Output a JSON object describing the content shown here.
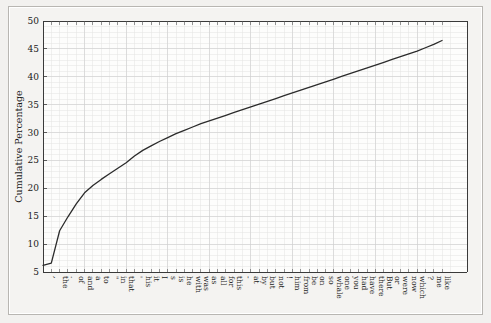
{
  "window": {
    "background_color": "#f2f1ef",
    "frame_color": "#f4f3f1"
  },
  "chart_data": {
    "type": "line",
    "title": "",
    "subtitle": "",
    "xlabel": "",
    "ylabel": "Cumulative Percentage",
    "ylim": [
      5,
      50
    ],
    "xlim": [
      0,
      51
    ],
    "grid": true,
    "legend": "none",
    "y_ticks": [
      5,
      10,
      15,
      20,
      25,
      30,
      35,
      40,
      45,
      50
    ],
    "y_tick_labels": [
      "5",
      "10",
      "15",
      "20",
      "25",
      "30",
      "35",
      "40",
      "45",
      "50"
    ],
    "line_color": "#2b2b2b",
    "categories": [
      ",",
      "the",
      ".",
      "of",
      "and",
      "a",
      "to",
      "\"",
      "in",
      "that",
      "'",
      "his",
      "it",
      "I",
      "s",
      "is",
      "he",
      "with",
      "was",
      "as",
      "all",
      "for",
      "this",
      "-",
      "at",
      "by",
      "but",
      "not",
      "!",
      "him",
      "from",
      "be",
      "on",
      "so",
      "whale",
      "one",
      "you",
      "had",
      "have",
      "there",
      "But",
      "or",
      "were",
      "now",
      "which",
      "?",
      "me",
      "like"
    ],
    "values": [
      6.6,
      12.4,
      14.9,
      17.2,
      19.2,
      20.5,
      21.6,
      22.6,
      23.6,
      24.6,
      25.8,
      26.8,
      27.6,
      28.4,
      29.1,
      29.8,
      30.4,
      31.0,
      31.6,
      32.1,
      32.6,
      33.1,
      33.6,
      34.1,
      34.6,
      35.1,
      35.6,
      36.1,
      36.6,
      37.1,
      37.6,
      38.1,
      38.6,
      39.1,
      39.6,
      40.1,
      40.6,
      41.1,
      41.6,
      42.1,
      42.6,
      43.1,
      43.6,
      44.1,
      44.6,
      45.2,
      45.8,
      46.5
    ]
  }
}
